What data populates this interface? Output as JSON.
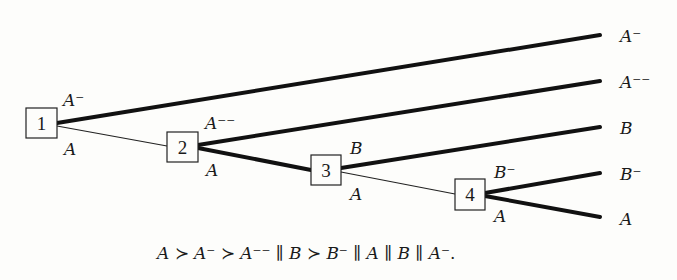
{
  "diagram": {
    "nodes": [
      {
        "id": "1",
        "label": "1"
      },
      {
        "id": "2",
        "label": "2"
      },
      {
        "id": "3",
        "label": "3"
      },
      {
        "id": "4",
        "label": "4"
      }
    ],
    "edges": [
      {
        "from": "1",
        "to": "leaf-A-minus",
        "label": "A⁻",
        "weight": "thick"
      },
      {
        "from": "1",
        "to": "2",
        "label": "A",
        "weight": "thin"
      },
      {
        "from": "2",
        "to": "leaf-A-minus-minus",
        "label": "A⁻⁻",
        "weight": "thick"
      },
      {
        "from": "2",
        "to": "3",
        "label": "A",
        "weight": "thick"
      },
      {
        "from": "3",
        "to": "leaf-B",
        "label": "B",
        "weight": "thick"
      },
      {
        "from": "3",
        "to": "4",
        "label": "A",
        "weight": "thin"
      },
      {
        "from": "4",
        "to": "leaf-B-minus",
        "label": "B⁻",
        "weight": "thick"
      },
      {
        "from": "4",
        "to": "leaf-A",
        "label": "A",
        "weight": "thick"
      }
    ],
    "leaves": [
      {
        "id": "leaf-A-minus",
        "label": "A⁻"
      },
      {
        "id": "leaf-A-minus-minus",
        "label": "A⁻⁻"
      },
      {
        "id": "leaf-B",
        "label": "B"
      },
      {
        "id": "leaf-B-minus",
        "label": "B⁻"
      },
      {
        "id": "leaf-A",
        "label": "A"
      }
    ],
    "edge_labels": {
      "e1_upper": "A⁻",
      "e1_lower": "A",
      "e2_upper": "A⁻⁻",
      "e2_lower": "A",
      "e3_upper": "B",
      "e3_lower": "A",
      "e4_upper": "B⁻",
      "e4_lower": "A"
    },
    "formula": {
      "parts": [
        "A",
        " ≻ ",
        "A⁻",
        " ≻ ",
        "A⁻⁻",
        " ∥ ",
        "B",
        " ≻ ",
        "B⁻",
        " ∥ ",
        "A",
        " ∥ ",
        "B",
        " ∥ ",
        "A⁻",
        "."
      ],
      "text": "A ≻ A⁻ ≻ A⁻⁻ ∥ B ≻ B⁻ ∥ A ∥ B ∥ A⁻."
    }
  }
}
